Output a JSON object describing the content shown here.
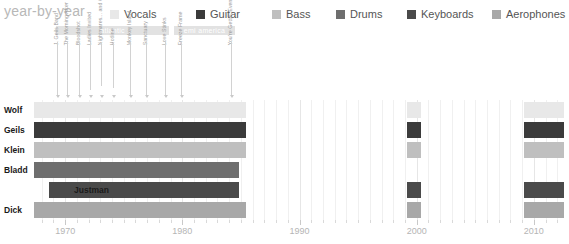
{
  "header": {
    "title": "year-by-year",
    "legend": [
      {
        "label": "Vocals",
        "color": "#e8e8e8",
        "x": 110
      },
      {
        "label": "Guitar",
        "color": "#3b3b3b",
        "x": 196
      },
      {
        "label": "Bass",
        "color": "#bfbfbf",
        "x": 272
      },
      {
        "label": "Drums",
        "color": "#6e6e6e",
        "x": 336
      },
      {
        "label": "Keyboards",
        "color": "#4a4a4a",
        "x": 407
      },
      {
        "label": "Aerophones",
        "color": "#a8a8a8",
        "x": 492
      }
    ]
  },
  "labels": [
    {
      "name": "atlantic",
      "x": 56,
      "w": 113
    },
    {
      "name": "emi america",
      "x": 174,
      "w": 61
    }
  ],
  "albums": [
    {
      "title": "J. Geils Band",
      "x": 57,
      "lead": 0
    },
    {
      "title": "The Morning After",
      "x": 67,
      "lead": 0
    },
    {
      "title": "Bloodshot",
      "x": 79,
      "lead": 0
    },
    {
      "title": "Ladies Invited",
      "x": 90,
      "lead": 6
    },
    {
      "title": "Nightmares... and Other Tales",
      "x": 101,
      "lead": 10
    },
    {
      "title": "Hotline",
      "x": 113,
      "lead": 8
    },
    {
      "title": "Monkey Island",
      "x": 130,
      "lead": 0
    },
    {
      "title": "Sanctuary",
      "x": 146,
      "lead": 0
    },
    {
      "title": "Love Stinks",
      "x": 165,
      "lead": 0
    },
    {
      "title": "Freeze Frame",
      "x": 181,
      "lead": 0
    },
    {
      "title": "You're Gettin' Even While I'm Gettin' Odd",
      "x": 231,
      "lead": 0
    }
  ],
  "chart_data": {
    "type": "bar",
    "title": "year-by-year",
    "xlabel": "",
    "ylabel": "",
    "xlim": [
      1967,
      2013
    ],
    "grid": true,
    "legend_position": "top",
    "xticks": [
      1970,
      1980,
      1990,
      2000,
      2010
    ],
    "categories": [
      "Wolf",
      "Geils",
      "Klein",
      "Bladd",
      "Justman",
      "Dick"
    ],
    "series": [
      {
        "name": "Wolf",
        "role": "Vocals",
        "color": "#e8e8e8",
        "segments": [
          {
            "from": 1967.3,
            "to": 1985.4,
            "style": "solid"
          },
          {
            "from": 1999.2,
            "to": 2000.4,
            "style": "solid"
          },
          {
            "from": 2009.2,
            "to": 2012.6,
            "style": "solid"
          }
        ]
      },
      {
        "name": "Geils",
        "role": "Guitar",
        "color": "#3b3b3b",
        "segments": [
          {
            "from": 1967.3,
            "to": 1985.4,
            "style": "solid"
          },
          {
            "from": 1986.0,
            "to": 1999.0,
            "style": "striped"
          },
          {
            "from": 1999.2,
            "to": 2000.4,
            "style": "solid"
          },
          {
            "from": 2000.8,
            "to": 2009.0,
            "style": "striped"
          },
          {
            "from": 2009.2,
            "to": 2012.6,
            "style": "solid"
          }
        ]
      },
      {
        "name": "Klein",
        "role": "Bass",
        "color": "#bfbfbf",
        "segments": [
          {
            "from": 1967.3,
            "to": 1985.4,
            "style": "solid"
          },
          {
            "from": 1986.0,
            "to": 1999.0,
            "style": "striped"
          },
          {
            "from": 1999.2,
            "to": 2000.4,
            "style": "solid"
          },
          {
            "from": 2000.8,
            "to": 2009.0,
            "style": "striped"
          },
          {
            "from": 2009.2,
            "to": 2012.6,
            "style": "solid"
          }
        ]
      },
      {
        "name": "Bladd",
        "role": "Drums",
        "color": "#6e6e6e",
        "segments": [
          {
            "from": 1967.3,
            "to": 1984.8,
            "style": "solid"
          }
        ]
      },
      {
        "name": "Justman",
        "role": "Keyboards",
        "color": "#4a4a4a",
        "segments": [
          {
            "from": 1968.6,
            "to": 1984.8,
            "style": "hatch"
          },
          {
            "from": 1986.0,
            "to": 1999.0,
            "style": "striped"
          },
          {
            "from": 1999.2,
            "to": 2000.4,
            "style": "hatch"
          },
          {
            "from": 2000.8,
            "to": 2009.0,
            "style": "striped"
          },
          {
            "from": 2009.2,
            "to": 2012.6,
            "style": "hatch"
          }
        ]
      },
      {
        "name": "Dick",
        "role": "Aerophones",
        "color": "#a8a8a8",
        "segments": [
          {
            "from": 1967.3,
            "to": 1985.4,
            "style": "solid"
          },
          {
            "from": 1986.0,
            "to": 1999.0,
            "style": "striped"
          },
          {
            "from": 1999.2,
            "to": 2000.4,
            "style": "solid"
          },
          {
            "from": 2000.8,
            "to": 2009.0,
            "style": "striped"
          },
          {
            "from": 2009.2,
            "to": 2012.6,
            "style": "solid"
          }
        ]
      }
    ]
  }
}
